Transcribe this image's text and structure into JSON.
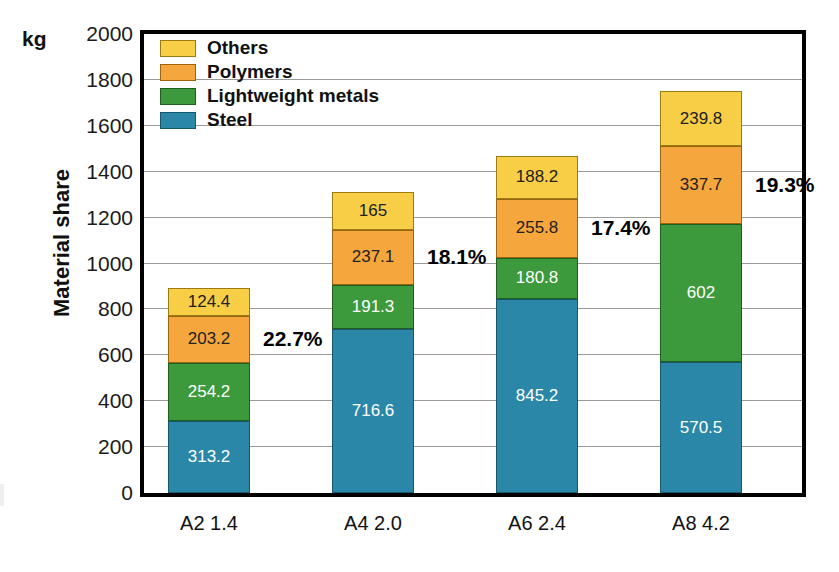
{
  "axis": {
    "unit": "kg",
    "y_title": "Material share",
    "y_ticks": [
      "2000",
      "1800",
      "1600",
      "1400",
      "1200",
      "1000",
      "800",
      "600",
      "400",
      "200",
      "0"
    ]
  },
  "legend": {
    "items": [
      {
        "label": "Others",
        "color": "#f7ce46",
        "key": "others"
      },
      {
        "label": "Polymers",
        "color": "#f5a63c",
        "key": "polymers"
      },
      {
        "label": "Lightweight metals",
        "color": "#3c9a3c",
        "key": "metals"
      },
      {
        "label": "Steel",
        "color": "#2a87a8",
        "key": "steel"
      }
    ]
  },
  "categories": [
    "A2 1.4",
    "A4 2.0",
    "A6 2.4",
    "A8 4.2"
  ],
  "annotations": [
    "22.7%",
    "18.1%",
    "17.4%",
    "19.3%"
  ],
  "bars": [
    {
      "category": "A2 1.4",
      "annotation": "22.7%",
      "segments": [
        {
          "name": "Others",
          "value": "124.4"
        },
        {
          "name": "Polymers",
          "value": "203.2"
        },
        {
          "name": "Lightweight metals",
          "value": "254.2"
        },
        {
          "name": "Steel",
          "value": "313.2"
        }
      ]
    },
    {
      "category": "A4 2.0",
      "annotation": "18.1%",
      "segments": [
        {
          "name": "Others",
          "value": "165"
        },
        {
          "name": "Polymers",
          "value": "237.1"
        },
        {
          "name": "Lightweight metals",
          "value": "191.3"
        },
        {
          "name": "Steel",
          "value": "716.6"
        }
      ]
    },
    {
      "category": "A6 2.4",
      "annotation": "17.4%",
      "segments": [
        {
          "name": "Others",
          "value": "188.2"
        },
        {
          "name": "Polymers",
          "value": "255.8"
        },
        {
          "name": "Lightweight metals",
          "value": "180.8"
        },
        {
          "name": "Steel",
          "value": "845.2"
        }
      ]
    },
    {
      "category": "A8 4.2",
      "annotation": "19.3%",
      "segments": [
        {
          "name": "Others",
          "value": "239.8"
        },
        {
          "name": "Polymers",
          "value": "337.7"
        },
        {
          "name": "Lightweight metals",
          "value": "602"
        },
        {
          "name": "Steel",
          "value": "570.5"
        }
      ]
    }
  ],
  "chart_data": {
    "type": "bar",
    "subtype": "stacked",
    "title": "",
    "xlabel": "",
    "ylabel": "Material share",
    "yunit": "kg",
    "ylim": [
      0,
      2000
    ],
    "ytick_step": 200,
    "yticks": [
      0,
      200,
      400,
      600,
      800,
      1000,
      1200,
      1400,
      1600,
      1800,
      2000
    ],
    "grid": "horizontal",
    "legend_position": "top-left-inside",
    "categories": [
      "A2 1.4",
      "A4 2.0",
      "A6 2.4",
      "A8 4.2"
    ],
    "series": [
      {
        "name": "Steel",
        "color": "#2a87a8",
        "values": [
          313.2,
          716.6,
          845.2,
          570.5
        ]
      },
      {
        "name": "Lightweight metals",
        "color": "#3c9a3c",
        "values": [
          254.2,
          191.3,
          180.8,
          602
        ]
      },
      {
        "name": "Polymers",
        "color": "#f5a63c",
        "values": [
          203.2,
          237.1,
          255.8,
          337.7
        ]
      },
      {
        "name": "Others",
        "color": "#f7ce46",
        "values": [
          124.4,
          165,
          188.2,
          239.8
        ]
      }
    ],
    "stack_order_bottom_to_top": [
      "Steel",
      "Lightweight metals",
      "Polymers",
      "Others"
    ],
    "totals": [
      895.0,
      1310.0,
      1470.0,
      1750.0
    ],
    "annotations": [
      {
        "category": "A2 1.4",
        "text": "22.7%"
      },
      {
        "category": "A4 2.0",
        "text": "18.1%"
      },
      {
        "category": "A6 2.4",
        "text": "17.4%"
      },
      {
        "category": "A8 4.2",
        "text": "19.3%"
      }
    ]
  }
}
